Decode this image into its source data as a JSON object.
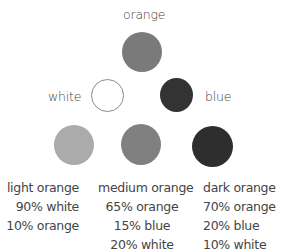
{
  "primaries": {
    "orange": {
      "label": "orange",
      "color": "#7a7a7a"
    },
    "white": {
      "label": "white",
      "color": "#ffffff",
      "border": "#8a8a8a"
    },
    "blue": {
      "label": "blue",
      "color": "#333333"
    }
  },
  "mixes": [
    {
      "name": "light orange",
      "color": "#ababab",
      "lines": [
        "90% white",
        "10% orange"
      ]
    },
    {
      "name": "medium orange",
      "color": "#808080",
      "lines": [
        "65% orange",
        "15% blue",
        "20% white"
      ]
    },
    {
      "name": "dark orange",
      "color": "#2e2e2e",
      "lines": [
        "70% orange",
        "20% blue",
        "10% white"
      ]
    }
  ]
}
